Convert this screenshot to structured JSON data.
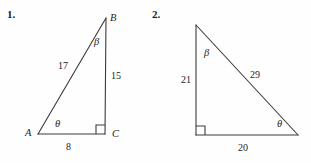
{
  "page": {
    "background_color": "#fefefe",
    "ink_color": "#3a3a3a",
    "text_color": "#242424"
  },
  "problems": [
    {
      "number_label": "1.",
      "figure_type": "right-triangle",
      "vertices": {
        "A": {
          "label": "A",
          "x": 38,
          "y": 134
        },
        "B": {
          "label": "B",
          "x": 106,
          "y": 18
        },
        "C": {
          "label": "C",
          "x": 105,
          "y": 134
        }
      },
      "right_angle_at": "C",
      "angles": [
        {
          "name": "theta",
          "label": "θ",
          "at_vertex": "A"
        },
        {
          "name": "beta",
          "label": "β",
          "at_vertex": "B"
        }
      ],
      "sides": [
        {
          "name": "hypotenuse",
          "label": "17",
          "from": "A",
          "to": "B"
        },
        {
          "name": "opposite",
          "label": "15",
          "from": "B",
          "to": "C"
        },
        {
          "name": "adjacent",
          "label": "8",
          "from": "A",
          "to": "C"
        }
      ]
    },
    {
      "number_label": "2.",
      "figure_type": "right-triangle",
      "vertices": {
        "top": {
          "label": "",
          "x": 196,
          "y": 25
        },
        "bottom_left": {
          "label": "",
          "x": 196,
          "y": 135
        },
        "bottom_right": {
          "label": "",
          "x": 298,
          "y": 135
        }
      },
      "right_angle_at": "bottom_left",
      "angles": [
        {
          "name": "beta",
          "label": "β",
          "at_vertex": "top"
        },
        {
          "name": "theta",
          "label": "θ",
          "at_vertex": "bottom_right"
        }
      ],
      "sides": [
        {
          "name": "vertical-leg",
          "label": "21",
          "from": "top",
          "to": "bottom_left"
        },
        {
          "name": "hypotenuse",
          "label": "29",
          "from": "top",
          "to": "bottom_right"
        },
        {
          "name": "horizontal-leg",
          "label": "20",
          "from": "bottom_left",
          "to": "bottom_right"
        }
      ]
    }
  ]
}
